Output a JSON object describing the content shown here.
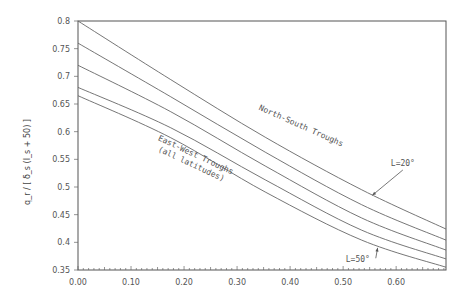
{
  "chart_data": {
    "type": "line",
    "title": "",
    "xlabel": "",
    "ylabel": "q_r / [ δ_s (I_s + 50) ]",
    "xlim": [
      0.0,
      0.694
    ],
    "ylim": [
      0.35,
      0.8
    ],
    "grid": false,
    "x_ticks": [
      0.0,
      0.1,
      0.2,
      0.3,
      0.4,
      0.5,
      0.6
    ],
    "x_tick_labels": [
      "0.00",
      "0.10",
      "0.20",
      "0.30",
      "0.40",
      "0.50",
      "0.60"
    ],
    "y_ticks": [
      0.35,
      0.4,
      0.45,
      0.5,
      0.55,
      0.6,
      0.65,
      0.7,
      0.75,
      0.8
    ],
    "y_tick_labels": [
      "0.35",
      "0.4",
      "0.45",
      "0.5",
      "0.55",
      "0.6",
      "0.65",
      "0.7",
      "0.75",
      "0.8"
    ],
    "x": [
      0.0,
      0.175,
      0.353,
      0.535,
      0.694
    ],
    "series": [
      {
        "name": "North-South Troughs, L=20°",
        "values": [
          0.8,
          0.694,
          0.59,
          0.495,
          0.424
        ]
      },
      {
        "name": "North-South Troughs (intermediate L)",
        "values": [
          0.76,
          0.663,
          0.563,
          0.468,
          0.404
        ]
      },
      {
        "name": "North-South Troughs (intermediate L)",
        "values": [
          0.72,
          0.636,
          0.538,
          0.444,
          0.386
        ]
      },
      {
        "name": "North-South Troughs, L=50°",
        "values": [
          0.68,
          0.607,
          0.513,
          0.422,
          0.37
        ]
      },
      {
        "name": "East-West Troughs (all latitudes)",
        "values": [
          0.665,
          0.589,
          0.491,
          0.404,
          0.355
        ]
      }
    ],
    "annotations": [
      {
        "text": "North-South Troughs",
        "x": 0.34,
        "y": 0.64,
        "rotation": 24
      },
      {
        "text": "East-West Troughs",
        "x": 0.15,
        "y": 0.585,
        "rotation": 25
      },
      {
        "text": "(all latitudes)",
        "x": 0.15,
        "y": 0.565,
        "rotation": 25
      },
      {
        "text": "L=20°",
        "x": 0.59,
        "y": 0.538,
        "arrow_to": [
          0.555,
          0.485
        ]
      },
      {
        "text": "L=50°",
        "x": 0.505,
        "y": 0.364,
        "arrow_to": [
          0.565,
          0.39
        ]
      }
    ]
  }
}
